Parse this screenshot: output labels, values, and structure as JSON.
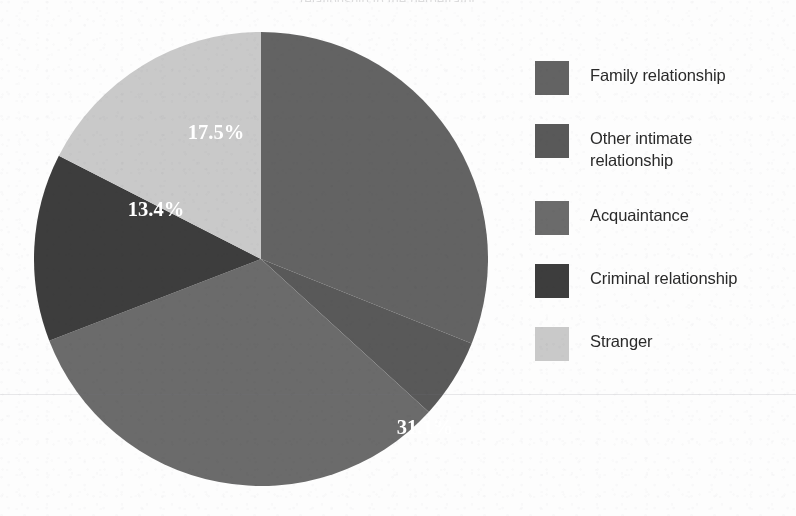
{
  "figure": {
    "title_sliver": "relationship to the perpetrator",
    "background_color": "#fdfdfd"
  },
  "chart_data": {
    "type": "pie",
    "title": "",
    "start_angle_deg": 0,
    "direction": "clockwise",
    "legend_position": "right",
    "grid": false,
    "categories": [
      "Family relationship",
      "Other intimate relationship",
      "Acquaintance",
      "Criminal relationship",
      "Stranger"
    ],
    "values": [
      31.1,
      5.7,
      32.4,
      13.4,
      17.5
    ],
    "value_labels": [
      "31.1%",
      "5.7%",
      "32.4",
      "13.4%",
      "17.5%"
    ],
    "colors": [
      "#636363",
      "#595959",
      "#6b6b6b",
      "#3d3d3d",
      "#c9c9c9"
    ],
    "label_color": "#ffffff",
    "units": "percent"
  },
  "pie": {
    "center_x": 228,
    "center_y": 228,
    "radius": 227,
    "slices": [
      {
        "name": "Family relationship",
        "value": 31.1,
        "label": "31.1%",
        "color": "#636363",
        "label_x": 164,
        "label_y": 175
      },
      {
        "name": "Other intimate relationship",
        "value": 5.7,
        "label": "5.7%",
        "color": "#595959",
        "label_x": 132,
        "label_y": 357
      },
      {
        "name": "Acquaintance",
        "value": 32.4,
        "label": "32.4",
        "color": "#6b6b6b",
        "label_x": -78,
        "label_y": 322
      },
      {
        "name": "Criminal relationship",
        "value": 13.4,
        "label": "13.4%",
        "color": "#3d3d3d",
        "label_x": -105,
        "label_y": -43
      },
      {
        "name": "Stranger",
        "value": 17.5,
        "label": "17.5%",
        "color": "#c9c9c9",
        "label_x": -45,
        "label_y": -120
      }
    ]
  },
  "legend": {
    "items": [
      {
        "label": "Family relationship",
        "color": "#636363"
      },
      {
        "label": "Other intimate\nrelationship",
        "color": "#595959"
      },
      {
        "label": "Acquaintance",
        "color": "#6b6b6b"
      },
      {
        "label": "Criminal relationship",
        "color": "#3d3d3d"
      },
      {
        "label": "Stranger",
        "color": "#c9c9c9"
      }
    ]
  }
}
